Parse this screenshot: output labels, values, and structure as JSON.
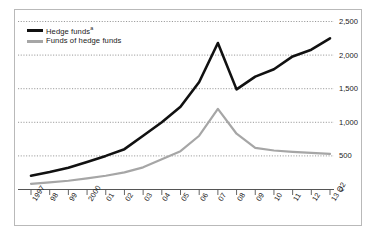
{
  "chart_data": {
    "type": "line",
    "title": "",
    "subtitle": "",
    "xlabel": "",
    "ylabel": "",
    "grid": true,
    "legend_position": "top-left",
    "x": [
      "1997",
      "98",
      "99",
      "2000",
      "01",
      "02",
      "03",
      "04",
      "05",
      "06",
      "07",
      "08",
      "09",
      "10",
      "11",
      "12",
      "13 Q2"
    ],
    "ylim": [
      0,
      2500
    ],
    "yticks": [
      0,
      500,
      1000,
      1500,
      2000,
      2500
    ],
    "ytick_labels": [
      "0",
      "500",
      "1,000",
      "1,500",
      "2,000",
      "2,500"
    ],
    "series": [
      {
        "name": "Hedge funds",
        "name_suffix": "a",
        "color": "#111111",
        "values": [
          205,
          260,
          325,
          410,
          500,
          600,
          800,
          1000,
          1230,
          1600,
          2180,
          1490,
          1680,
          1790,
          1980,
          2080,
          2250
        ]
      },
      {
        "name": "Funds of hedge funds",
        "name_suffix": "",
        "color": "#a6a6a6",
        "values": [
          85,
          105,
          130,
          165,
          205,
          255,
          330,
          450,
          570,
          800,
          1200,
          830,
          620,
          580,
          560,
          545,
          530
        ]
      }
    ]
  },
  "legend": {
    "hedge_funds_label": "Hedge funds",
    "hedge_funds_superscript": "a",
    "funds_of_hedge_funds_label": "Funds of hedge funds"
  },
  "axes": {
    "y_tick_labels": [
      "2,500",
      "2,000",
      "1,500",
      "1,000",
      "500",
      "0"
    ],
    "x_tick_labels": [
      "1997",
      "98",
      "99",
      "2000",
      "01",
      "02",
      "03",
      "04",
      "05",
      "06",
      "07",
      "08",
      "09",
      "10",
      "11",
      "12",
      "13 Q2"
    ]
  },
  "colors": {
    "hedge_funds": "#111111",
    "funds_of_hedge_funds": "#a6a6a6",
    "gridline": "#8c8c8c",
    "frame": "#b9b9b9",
    "axis": "#555555",
    "text": "#1a1a1a",
    "background": "#ffffff"
  }
}
